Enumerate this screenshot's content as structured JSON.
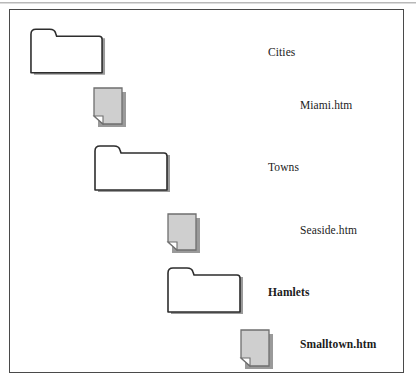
{
  "diagram": {
    "title": "",
    "type": "file-tree-hierarchy",
    "frame": {
      "border_color": "#4a4a4a",
      "background_color": "#ffffff"
    },
    "colors": {
      "folder_fill": "#ffffff",
      "folder_stroke": "#2d2d2d",
      "document_fill": "#cfcfcf",
      "document_stroke": "#6f6f6f",
      "shadow": "#9a9a9a",
      "text": "#1b1b1b"
    },
    "nodes": [
      {
        "id": "cities",
        "label": "Cities",
        "icon": "folder-icon",
        "icon_type": "folder",
        "bold": false,
        "indent_level": 0,
        "icon_x": 18,
        "icon_y": 16,
        "icon_w": 80,
        "icon_h": 53,
        "label_x": 258,
        "label_y": 36
      },
      {
        "id": "miami-htm",
        "label": "Miami.htm",
        "icon": "document-icon",
        "icon_type": "document",
        "bold": false,
        "indent_level": 1,
        "icon_x": 81,
        "icon_y": 76,
        "icon_w": 38,
        "icon_h": 44,
        "label_x": 290,
        "label_y": 89
      },
      {
        "id": "towns",
        "label": "Towns",
        "icon": "folder-icon",
        "icon_type": "folder",
        "bold": false,
        "indent_level": 1,
        "icon_x": 82,
        "icon_y": 133,
        "icon_w": 81,
        "icon_h": 53,
        "label_x": 258,
        "label_y": 151
      },
      {
        "id": "seaside-htm",
        "label": "Seaside.htm",
        "icon": "document-icon",
        "icon_type": "document",
        "bold": false,
        "indent_level": 2,
        "icon_x": 155,
        "icon_y": 202,
        "icon_w": 38,
        "icon_h": 44,
        "label_x": 290,
        "label_y": 214
      },
      {
        "id": "hamlets",
        "label": "Hamlets",
        "icon": "folder-icon",
        "icon_type": "folder",
        "bold": true,
        "indent_level": 2,
        "icon_x": 155,
        "icon_y": 255,
        "icon_w": 81,
        "icon_h": 53,
        "label_x": 258,
        "label_y": 276
      },
      {
        "id": "smalltown-htm",
        "label": "Smalltown.htm",
        "icon": "document-icon",
        "icon_type": "document",
        "bold": true,
        "indent_level": 3,
        "icon_x": 228,
        "icon_y": 318,
        "icon_w": 38,
        "icon_h": 44,
        "label_x": 290,
        "label_y": 328
      }
    ]
  }
}
